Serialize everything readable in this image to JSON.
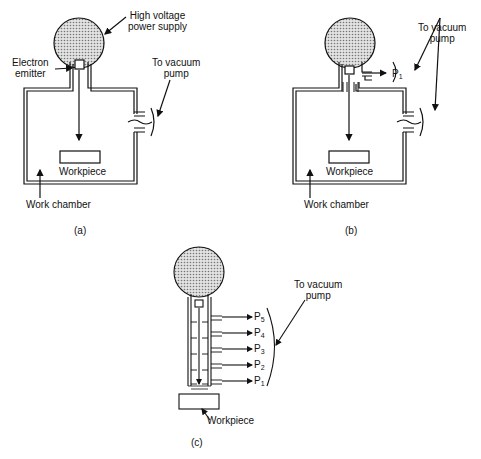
{
  "panel_a": {
    "power_supply_label_line1": "High voltage",
    "power_supply_label_line2": "power supply",
    "emitter_label_line1": "Electron",
    "emitter_label_line2": "emitter",
    "vacuum_label_line1": "To vacuum",
    "vacuum_label_line2": "pump",
    "workpiece_label": "Workpiece",
    "chamber_label": "Work chamber",
    "caption": "(a)"
  },
  "panel_b": {
    "vacuum_label_line1": "To vacuum",
    "vacuum_label_line2": "pump",
    "p1": "P",
    "p1_sub": "1",
    "workpiece_label": "Workpiece",
    "chamber_label": "Work chamber",
    "caption": "(b)"
  },
  "panel_c": {
    "vacuum_label_line1": "To vacuum",
    "vacuum_label_line2": "pump",
    "stages": [
      {
        "p": "P",
        "sub": "5"
      },
      {
        "p": "P",
        "sub": "4"
      },
      {
        "p": "P",
        "sub": "3"
      },
      {
        "p": "P",
        "sub": "2"
      },
      {
        "p": "P",
        "sub": "1"
      }
    ],
    "workpiece_label": "Workpiece",
    "caption": "(c)"
  },
  "colors": {
    "ink": "#111111",
    "stipple": "#bdbdbd",
    "background": "#ffffff"
  }
}
